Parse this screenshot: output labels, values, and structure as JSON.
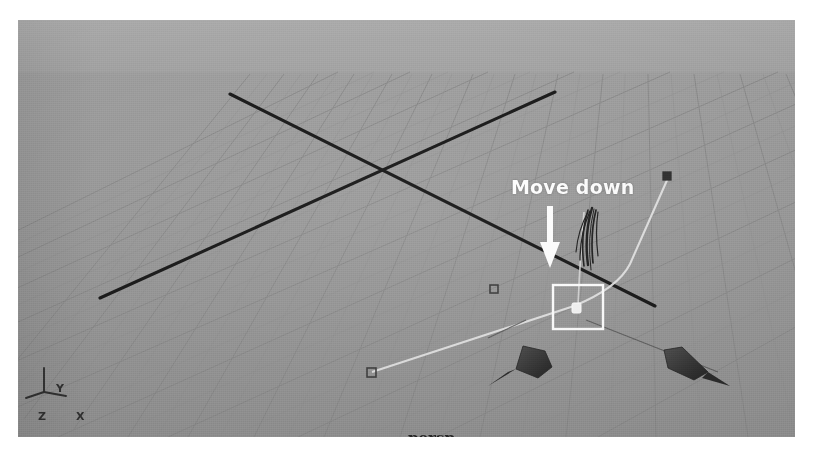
{
  "app": {
    "kind": "3d-viewport-screenshot",
    "viewport_background": "#9a9a9a",
    "page_background": "#ffffff"
  },
  "viewport": {
    "label": "persp",
    "label_color": "#1f1f1f",
    "grid": {
      "line_color": "#8a8a8a",
      "axis_line_color": "#151515",
      "rows": 12,
      "cols": 14
    },
    "axis_gizmo": {
      "y_label": "Y",
      "z_label": "Z",
      "x_label": "X",
      "color": "#2b2b2b"
    }
  },
  "annotation": {
    "label": "Move down",
    "label_color": "#ffffff",
    "arrow": {
      "direction": "down",
      "color": "#ffffff"
    }
  },
  "scene": {
    "curve": {
      "name": "nurbs-curve",
      "color": "#e8e8e8",
      "selected_cv": {
        "name": "selected-control-vertex",
        "marker": "filled-square",
        "color": "#f2f2f2",
        "selection_box_color": "#ffffff"
      },
      "cv_markers": [
        {
          "name": "cv-marker-lower-left",
          "marker": "hollow-square",
          "color": "#3a3a3a"
        },
        {
          "name": "cv-marker-middle",
          "marker": "hollow-square",
          "color": "#3a3a3a"
        },
        {
          "name": "cv-marker-upper-right",
          "marker": "filled-square",
          "color": "#2a2a2a"
        }
      ]
    },
    "hair_guides": {
      "name": "hair-guide-cluster",
      "color": "#1a1a1a",
      "strand_count": 6
    },
    "cones": [
      {
        "name": "cone-left",
        "color": "#3b3b3b",
        "direction": "down-left"
      },
      {
        "name": "cone-right",
        "color": "#3b3b3b",
        "direction": "down-right"
      }
    ]
  }
}
